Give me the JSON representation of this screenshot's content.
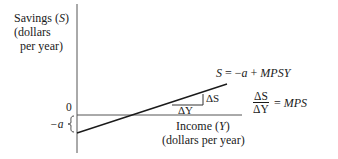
{
  "diagram": {
    "y_axis_label": {
      "line1_prefix": "Savings (",
      "line1_var": "S",
      "line1_suffix": ")",
      "line2": "(dollars",
      "line3": "per year)"
    },
    "x_axis_label": {
      "line1_prefix": "Income (",
      "line1_var": "Y",
      "line1_suffix": ")",
      "line2": "(dollars per year)"
    },
    "origin_label": "0",
    "intercept_label": "−a",
    "equation": {
      "lhs": "S",
      "eq": " = −",
      "a": "a",
      "plus": " + ",
      "rhs": "MPSY"
    },
    "slope_formula": {
      "numerator": "ΔS",
      "denominator": "ΔY",
      "eq": " = ",
      "rhs": "MPS"
    },
    "triangle_labels": {
      "delta_s": "ΔS",
      "delta_y": "ΔY"
    },
    "colors": {
      "ink": "#1a1a1a",
      "axis": "#555555",
      "background": "#ffffff"
    }
  }
}
